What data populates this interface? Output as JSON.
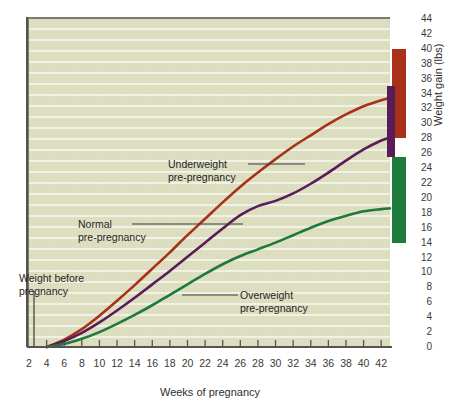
{
  "chart_data": {
    "type": "line",
    "title": "",
    "xlabel": "Weeks of pregnancy",
    "ylabel": "Weight gain (lbs)",
    "xlim": [
      2,
      43
    ],
    "ylim": [
      0,
      44
    ],
    "grid": true,
    "legend_position": "inline-annotations",
    "x_ticks": [
      2,
      4,
      6,
      8,
      10,
      12,
      14,
      16,
      18,
      20,
      22,
      24,
      26,
      28,
      30,
      32,
      34,
      36,
      38,
      40,
      42
    ],
    "y_ticks": [
      0,
      2,
      4,
      6,
      8,
      10,
      12,
      14,
      16,
      18,
      20,
      22,
      24,
      26,
      28,
      30,
      32,
      34,
      36,
      38,
      40,
      42,
      44
    ],
    "x": [
      4,
      6,
      8,
      10,
      12,
      14,
      16,
      18,
      20,
      22,
      24,
      26,
      28,
      30,
      32,
      34,
      36,
      38,
      40,
      42,
      43
    ],
    "series": [
      {
        "name": "Underweight pre-pregnancy",
        "color": "#a93119",
        "values": [
          0,
          1.0,
          2.4,
          4.2,
          6.2,
          8.3,
          10.5,
          12.7,
          15.0,
          17.2,
          19.4,
          21.5,
          23.4,
          25.2,
          26.9,
          28.4,
          29.9,
          31.2,
          32.3,
          33.1,
          33.4
        ]
      },
      {
        "name": "Normal pre-pregnancy",
        "color": "#5a1b59",
        "values": [
          0,
          0.8,
          1.9,
          3.3,
          4.9,
          6.6,
          8.4,
          10.2,
          12.1,
          14.0,
          15.9,
          17.7,
          18.9,
          19.6,
          20.6,
          21.9,
          23.4,
          25.0,
          26.5,
          27.7,
          28.1
        ]
      },
      {
        "name": "Overweight pre-pregnancy",
        "color": "#1d7a3c",
        "values": [
          0,
          0.4,
          1.1,
          2.0,
          3.1,
          4.3,
          5.6,
          7.0,
          8.4,
          9.8,
          11.1,
          12.2,
          13.1,
          14.0,
          15.0,
          16.0,
          16.9,
          17.6,
          18.2,
          18.5,
          18.6
        ]
      }
    ],
    "recommended_ranges": [
      {
        "name": "underweight-range",
        "color": "#a93119",
        "low": 28,
        "high": 40
      },
      {
        "name": "normal-range",
        "color": "#5a1b59",
        "low": 25.5,
        "high": 35
      },
      {
        "name": "overweight-range",
        "color": "#1d7a3c",
        "low": 14,
        "high": 25.5
      }
    ],
    "annotations": [
      {
        "name": "underweight-label",
        "line1": "Underweight",
        "line2": "pre-pregnancy"
      },
      {
        "name": "normal-label",
        "line1": "Normal",
        "line2": "pre-pregnancy"
      },
      {
        "name": "overweight-label",
        "line1": "Overweight",
        "line2": "pre-pregnancy"
      },
      {
        "name": "weight-before-label",
        "line1": "Weight before",
        "line2": "pregnancy"
      }
    ]
  },
  "axes": {
    "x_title": "Weeks of pregnancy",
    "y_title": "Weight gain (lbs)"
  },
  "colors": {
    "plot_background": "#dddfc0",
    "gridline": "#f2f3e2",
    "axis": "#55554e",
    "underweight": "#a93119",
    "normal": "#5a1b59",
    "overweight": "#1d7a3c",
    "text": "#2e2e2c"
  }
}
